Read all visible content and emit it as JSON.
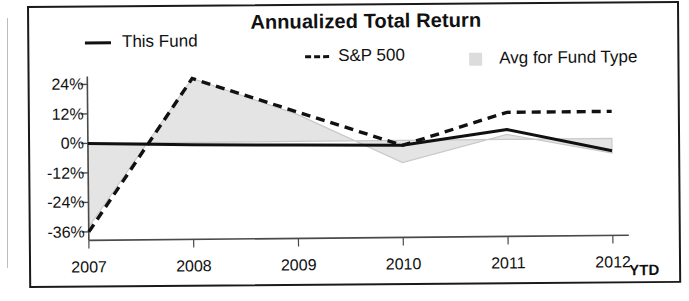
{
  "chart_data": {
    "type": "line",
    "title": "Annualized Total Return",
    "xlabel": "",
    "ylabel": "",
    "categories": [
      "2007",
      "2008",
      "2009",
      "2010",
      "2011",
      "2012"
    ],
    "x_tick_suffix": "YTD",
    "y_ticks": [
      "24%",
      "12%",
      "0%",
      "-12%",
      "-24%",
      "-36%"
    ],
    "y_tick_values": [
      24,
      12,
      0,
      -12,
      -24,
      -36
    ],
    "ylim": [
      -38,
      30
    ],
    "grid": false,
    "legend_position": "top",
    "series": [
      {
        "name": "This Fund",
        "style": "solid",
        "color": "#111111",
        "values": [
          0,
          -1,
          -1.5,
          -2,
          4,
          -5
        ]
      },
      {
        "name": "S&P 500",
        "style": "dashed",
        "color": "#111111",
        "values": [
          -36,
          26,
          12,
          -2,
          11,
          11
        ]
      },
      {
        "name": "Avg for Fund Type",
        "style": "area",
        "color": "#e4e4e4",
        "values": [
          -34,
          26,
          11,
          -9,
          2,
          -6
        ]
      }
    ]
  },
  "legend": {
    "fund_label": "This Fund",
    "sp_label": "S&P 500",
    "avg_label": "Avg for Fund Type"
  },
  "colors": {
    "line": "#111111",
    "area_fill": "#e4e4e4",
    "area_edge": "#c9c9c9",
    "axis": "#4a4a4a",
    "frame": "#1a1a1a"
  }
}
